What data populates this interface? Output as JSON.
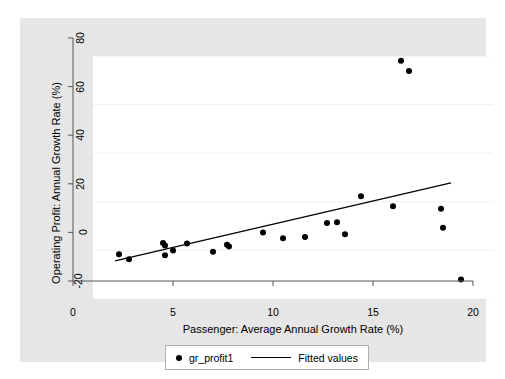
{
  "chart_data": {
    "type": "scatter",
    "title": "",
    "xlabel": "Passenger: Average Annual Growth Rate (%)",
    "ylabel": "Operating Profit: Annual Growth Rate (%)",
    "xlim": [
      0,
      20
    ],
    "ylim": [
      -20,
      80
    ],
    "xticks": [
      0,
      5,
      10,
      15,
      20
    ],
    "xtick_labels": [
      "0",
      "5",
      "10",
      "15",
      "20"
    ],
    "yticks": [
      -20,
      0,
      20,
      40,
      60,
      80
    ],
    "ytick_labels": [
      "-20",
      "0",
      "20",
      "40",
      "60",
      "80"
    ],
    "grid": "horizontal",
    "grid_color": "#f0f0f0",
    "plot_bg": "#ffffff",
    "graph_bg": "#e6e6e6",
    "marker_color": "#000000",
    "line_color": "#000000",
    "legend_position": "bottom",
    "series": [
      {
        "name": "gr_profit1",
        "type": "scatter",
        "points": [
          [
            1.3,
            -1.6
          ],
          [
            1.8,
            -3.6
          ],
          [
            3.5,
            3.0
          ],
          [
            3.6,
            2.0
          ],
          [
            3.6,
            -2.0
          ],
          [
            4.0,
            0.0
          ],
          [
            4.7,
            2.8
          ],
          [
            6.0,
            -0.6
          ],
          [
            6.7,
            2.3
          ],
          [
            6.8,
            1.6
          ],
          [
            8.5,
            7.4
          ],
          [
            9.5,
            5.0
          ],
          [
            10.6,
            5.5
          ],
          [
            11.7,
            11.3
          ],
          [
            12.2,
            11.6
          ],
          [
            12.6,
            6.6
          ],
          [
            13.4,
            22.3
          ],
          [
            15.0,
            18.2
          ],
          [
            15.4,
            78.0
          ],
          [
            15.8,
            73.8
          ],
          [
            17.4,
            17.1
          ],
          [
            17.5,
            9.3
          ],
          [
            18.4,
            -12.0
          ]
        ]
      },
      {
        "name": "Fitted values",
        "type": "line",
        "points": [
          [
            1.1,
            -4.3
          ],
          [
            17.9,
            27.8
          ]
        ]
      }
    ]
  },
  "legend": {
    "entries": [
      {
        "label": "gr_profit1",
        "marker": "dot-marker-icon"
      },
      {
        "label": "Fitted values",
        "marker": "line-marker-icon"
      }
    ]
  }
}
